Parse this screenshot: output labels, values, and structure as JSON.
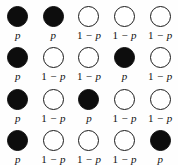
{
  "figure": {
    "name": "bernoulli-node-grid",
    "background_color": "#fefefe",
    "filled_color": "#0d0d0d",
    "open_color": "#ffffff",
    "outline_color": "#1a1a1a",
    "columns": 5,
    "rows": 4,
    "labels": {
      "filled": "p",
      "open_number": "1",
      "open_operator": "−",
      "open_variable": "p",
      "filled_full": "p",
      "open_full": "1 − p"
    },
    "grid": [
      [
        {
          "state": "filled",
          "label": "p"
        },
        {
          "state": "filled",
          "label": "p"
        },
        {
          "state": "open",
          "label": "1 − p"
        },
        {
          "state": "open",
          "label": "1 − p"
        },
        {
          "state": "open",
          "label": "1 − p"
        }
      ],
      [
        {
          "state": "filled",
          "label": "p"
        },
        {
          "state": "open",
          "label": "1 − p"
        },
        {
          "state": "open",
          "label": "1 − p"
        },
        {
          "state": "filled",
          "label": "p"
        },
        {
          "state": "open",
          "label": "1 − p"
        }
      ],
      [
        {
          "state": "filled",
          "label": "p"
        },
        {
          "state": "open",
          "label": "1 − p"
        },
        {
          "state": "filled",
          "label": "p"
        },
        {
          "state": "open",
          "label": "1 − p"
        },
        {
          "state": "open",
          "label": "1 − p"
        }
      ],
      [
        {
          "state": "filled",
          "label": "p"
        },
        {
          "state": "open",
          "label": "1 − p"
        },
        {
          "state": "open",
          "label": "1 − p"
        },
        {
          "state": "open",
          "label": "1 − p"
        },
        {
          "state": "filled",
          "label": "p"
        }
      ]
    ]
  }
}
